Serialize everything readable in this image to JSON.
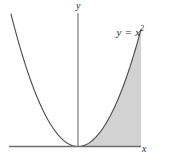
{
  "figure": {
    "name": "parabola-area-figure",
    "background_color": "#ffffff",
    "curve_color": "#4a4a4a",
    "axis_color": "#6e6e6e",
    "shade_color": "#d2d2d2",
    "labels": {
      "curve_equation_prefix": "y = x",
      "curve_equation_exponent": "2",
      "curve_equation_full": "y = x²",
      "y_axis": "y",
      "x_axis": "x"
    }
  },
  "chart_data": {
    "type": "line",
    "title": "",
    "subtitle": "",
    "xlabel": "x",
    "ylabel": "y",
    "annotations": [
      {
        "text": "y = x²",
        "x": 1.35,
        "y": 2.6
      }
    ],
    "grid": false,
    "legend": false,
    "legend_position": "none",
    "xlim": [
      -1.72,
      1.62
    ],
    "ylim": [
      0,
      2.96
    ],
    "series": [
      {
        "name": "y = x²",
        "function": "x^2",
        "color": "#4a4a4a",
        "x": [
          -1.72,
          -1.55,
          -1.38,
          -1.21,
          -1.03,
          -0.86,
          -0.69,
          -0.52,
          -0.34,
          -0.17,
          0.0,
          0.17,
          0.34,
          0.52,
          0.69,
          0.86,
          1.03,
          1.21,
          1.38,
          1.55,
          1.62
        ],
        "values": [
          2.96,
          2.4,
          1.9,
          1.46,
          1.06,
          0.74,
          0.48,
          0.27,
          0.12,
          0.03,
          0.0,
          0.03,
          0.12,
          0.27,
          0.48,
          0.74,
          1.06,
          1.46,
          1.9,
          2.4,
          2.62
        ]
      }
    ],
    "shaded_region": {
      "label": "area between the curve and the right boundary",
      "color": "#d2d2d2",
      "x_range": [
        0.0,
        1.62
      ],
      "bounded_above_by": "top of plot",
      "bounded_below_by": "y = x²",
      "bounded_right_by": "x = 1.62"
    },
    "axes": {
      "x_axis": {
        "label": "x",
        "y_value": 0,
        "arrow": false
      },
      "y_axis": {
        "label": "y",
        "x_value": 0,
        "arrow": false
      }
    }
  }
}
